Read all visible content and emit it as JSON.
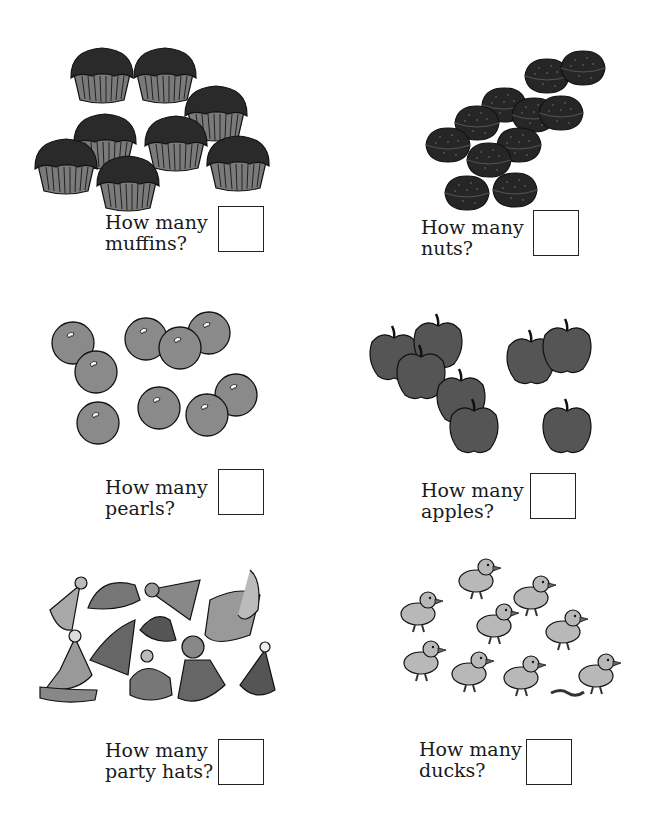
{
  "worksheet": {
    "sections": [
      {
        "id": "muffins",
        "line1": "How many",
        "line2": "muffins?",
        "item_count": 8
      },
      {
        "id": "nuts",
        "line1": "How many",
        "line2": "nuts?",
        "item_count": 11
      },
      {
        "id": "pearls",
        "line1": "How many",
        "line2": "pearls?",
        "item_count": 9
      },
      {
        "id": "apples",
        "line1": "How many",
        "line2": "apples?",
        "item_count": 8
      },
      {
        "id": "party-hats",
        "line1": "How many",
        "line2": "party hats?",
        "item_count": 12
      },
      {
        "id": "ducks",
        "line1": "How many",
        "line2": "ducks?",
        "item_count": 9
      }
    ]
  },
  "colors": {
    "dark_fill": "#2e2e2e",
    "mid_fill": "#8a8a8a",
    "apple_fill": "#555555",
    "light_fill": "#b8b8b8",
    "outline": "#111111"
  }
}
